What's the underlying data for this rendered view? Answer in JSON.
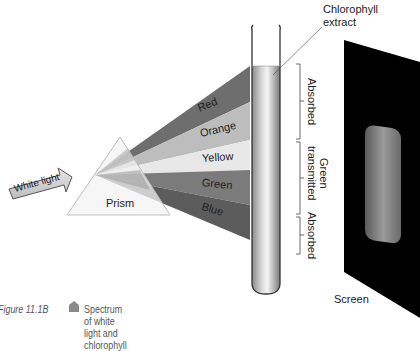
{
  "figure": {
    "caption_number": "Figure 11.1B",
    "caption_text": "Spectrum of white light and chlorophyll",
    "caption_marker": "diamond-bullet"
  },
  "light_source": {
    "label": "White light",
    "icon": "arrow-right"
  },
  "prism": {
    "label": "Prism"
  },
  "spectrum_bands": [
    {
      "name": "Red",
      "color": "#6e6e6e"
    },
    {
      "name": "Orange",
      "color": "#bdbdbd"
    },
    {
      "name": "Yellow",
      "color": "#e8e8e8"
    },
    {
      "name": "Green",
      "color": "#7b7b7b"
    },
    {
      "name": "Blue",
      "color": "#5c5c5c"
    }
  ],
  "test_tube": {
    "label_line1": "Chlorophyll",
    "label_line2": "extract"
  },
  "absorption_brackets": [
    {
      "label": "Absorbed"
    },
    {
      "label_line1": "Green",
      "label_line2": "transmitted"
    },
    {
      "label": "Absorbed"
    }
  ],
  "screen": {
    "label": "Screen",
    "color": "#000000"
  }
}
